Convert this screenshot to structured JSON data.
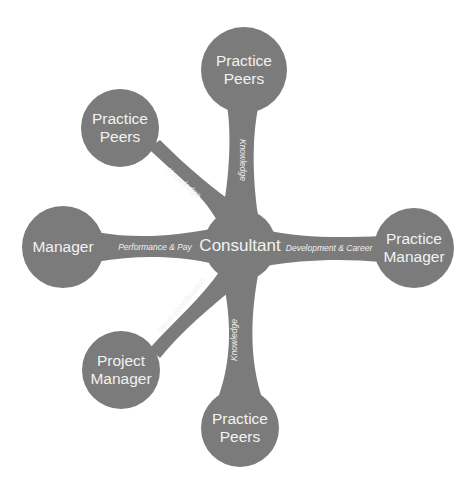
{
  "diagram": {
    "type": "hub-and-spoke relationship map",
    "fill_color": "#7b7b7b",
    "text_color": "#f2f2f2",
    "center": {
      "label": "Consultant"
    },
    "nodes": [
      {
        "id": "top",
        "label_lines": [
          "Practice",
          "Peers"
        ],
        "edge_label": "Knowledge"
      },
      {
        "id": "upper_left",
        "label_lines": [
          "Practice",
          "Peers"
        ],
        "edge_label": "Knowledge"
      },
      {
        "id": "left",
        "label_lines": [
          "Manager"
        ],
        "edge_label": "Performance & Pay"
      },
      {
        "id": "right",
        "label_lines": [
          "Practice",
          "Manager"
        ],
        "edge_label": "Development & Career"
      },
      {
        "id": "lower_left",
        "label_lines": [
          "Project",
          "Manager"
        ],
        "edge_label": "Work coordination"
      },
      {
        "id": "bottom",
        "label_lines": [
          "Practice",
          "Peers"
        ],
        "edge_label": "Knowledge"
      }
    ]
  }
}
